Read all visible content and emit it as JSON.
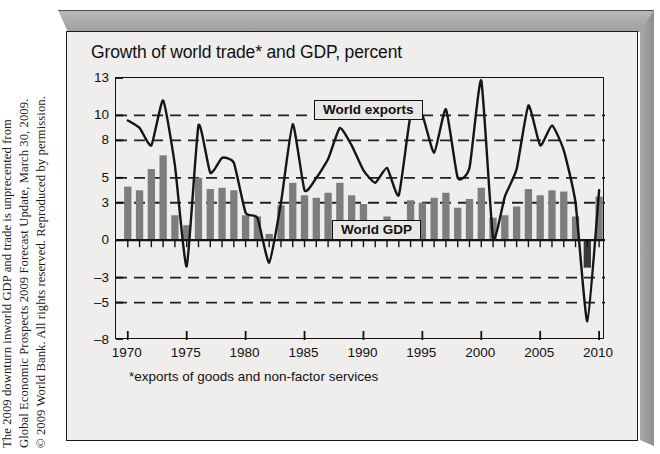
{
  "credit": {
    "line1": "The 2009 downturn inworld GDP and trade is unprecented from",
    "line2": "Global Economic Prospects 2009 Forecast Update, March 30, 2009.",
    "line3": "© 2009 World Bank. All rights reserved. Reproduced by permission."
  },
  "chart": {
    "title": "Growth of world trade* and GDP, percent",
    "footnote": "*exports of goods and non-factor services",
    "series_label_exports": "World exports",
    "series_label_gdp": "World GDP",
    "bar_color": "#7d7d7d",
    "bar_color_negative": "#3a3a3a",
    "line_color": "#151515",
    "grid_color": "#222222",
    "panel_color": "#efeeec"
  },
  "chart_data": {
    "type": "bar",
    "title": "Growth of world trade* and GDP, percent",
    "subtitle": "",
    "xlabel": "",
    "ylabel": "percent",
    "annotation": "*exports of goods and non-factor services",
    "grid": true,
    "legend_position": "in-plot",
    "xlim": [
      1969,
      2010.5
    ],
    "ylim": [
      -8,
      13
    ],
    "ytick_labels": [
      "13",
      "10",
      "8",
      "5",
      "3",
      "0",
      "-3",
      "-5",
      "-8"
    ],
    "ytick_values": [
      13,
      10,
      8,
      5,
      3,
      0,
      -3,
      -5,
      -8
    ],
    "gridline_values": [
      10,
      8,
      5,
      3,
      -3,
      -5
    ],
    "xtick_labels": [
      "1970",
      "1975",
      "1980",
      "1985",
      "1990",
      "1995",
      "2000",
      "2005",
      "2010"
    ],
    "xtick_values": [
      1970,
      1975,
      1980,
      1985,
      1990,
      1995,
      2000,
      2005,
      2010
    ],
    "x": [
      1970,
      1971,
      1972,
      1973,
      1974,
      1975,
      1976,
      1977,
      1978,
      1979,
      1980,
      1981,
      1982,
      1983,
      1984,
      1985,
      1986,
      1987,
      1988,
      1989,
      1990,
      1991,
      1992,
      1993,
      1994,
      1995,
      1996,
      1997,
      1998,
      1999,
      2000,
      2001,
      2002,
      2003,
      2004,
      2005,
      2006,
      2007,
      2008,
      2009,
      2010
    ],
    "series": [
      {
        "name": "World GDP",
        "type": "bar",
        "color": "#7d7d7d",
        "values": [
          4.3,
          4.0,
          5.7,
          6.8,
          2.0,
          1.2,
          5.0,
          4.1,
          4.2,
          4.0,
          2.0,
          1.9,
          0.5,
          2.8,
          4.6,
          3.6,
          3.4,
          3.8,
          4.6,
          3.6,
          2.9,
          1.4,
          1.9,
          1.6,
          3.2,
          3.0,
          3.4,
          3.8,
          2.6,
          3.3,
          4.2,
          1.8,
          2.0,
          2.7,
          4.1,
          3.6,
          4.0,
          3.9,
          1.9,
          -2.2,
          3.5
        ]
      },
      {
        "name": "World exports",
        "type": "line",
        "color": "#151515",
        "values": [
          9.6,
          9.0,
          7.6,
          11.2,
          6.0,
          -2.1,
          9.2,
          5.4,
          6.6,
          6.2,
          2.2,
          1.8,
          -1.8,
          3.0,
          9.3,
          4.0,
          5.0,
          6.5,
          9.0,
          7.6,
          5.6,
          4.6,
          5.8,
          3.6,
          10.0,
          10.0,
          7.0,
          10.5,
          5.0,
          5.8,
          12.8,
          0.2,
          3.5,
          5.7,
          10.8,
          7.6,
          9.2,
          7.2,
          3.0,
          -6.5,
          4.0
        ]
      }
    ]
  }
}
